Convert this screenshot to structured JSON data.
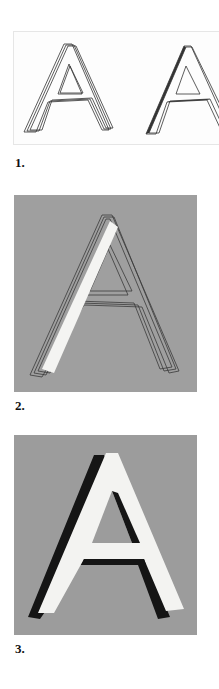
{
  "figure": {
    "panels": [
      {
        "id": "1",
        "label": "1.",
        "description": "Two outline drawings of the letter A with extruded depth lines",
        "background": "#fdfdfd"
      },
      {
        "id": "2",
        "label": "2.",
        "description": "Outline letter A on grey with white highlight on left stroke",
        "background": "#9f9f9f"
      },
      {
        "id": "3",
        "label": "3.",
        "description": "Painted white letter A with black drop shadow on grey",
        "background": "#9c9c9c"
      }
    ]
  }
}
